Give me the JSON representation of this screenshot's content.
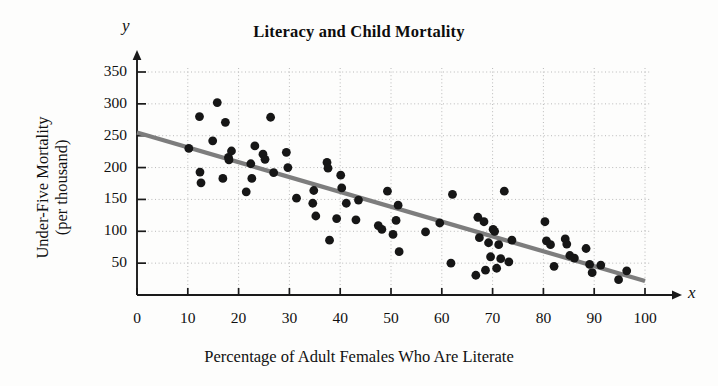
{
  "chart_data": {
    "type": "scatter",
    "title": "Literacy and Child Mortality",
    "xlabel": "Percentage of Adult Females Who Are Literate",
    "ylabel": "Under-Five Mortality\n(per thousand)",
    "ylabel_line1": "Under-Five Mortality",
    "ylabel_line2": "(per thousand)",
    "x_axis_letter": "y",
    "y_axis_letter": "x",
    "axis_letter_x": "x",
    "axis_letter_y": "y",
    "xlim": [
      0,
      100
    ],
    "ylim": [
      0,
      350
    ],
    "xticks": [
      0,
      10,
      20,
      30,
      40,
      50,
      60,
      70,
      80,
      90,
      100
    ],
    "yticks": [
      50,
      100,
      150,
      200,
      250,
      300,
      350
    ],
    "xtick_labels": [
      "0",
      "10",
      "20",
      "30",
      "40",
      "50",
      "60",
      "70",
      "80",
      "90",
      "100"
    ],
    "ytick_labels": [
      "50",
      "100",
      "150",
      "200",
      "250",
      "300",
      "350"
    ],
    "grid": true,
    "grid_style": "dotted",
    "legend": "none",
    "point_color": "#161616",
    "line_color": "#7d7d7d",
    "grid_color": "#b9b9b9",
    "axis_color": "#1a1a1a",
    "point_radius": 4.4,
    "trendline": {
      "name": "least-squares regression line",
      "x_start": 0,
      "y_start": 255,
      "x_end": 100,
      "y_end": 22,
      "slope": -2.33,
      "intercept": 255
    },
    "series": [
      {
        "name": "Countries",
        "points": [
          [
            10.2,
            230
          ],
          [
            12.3,
            280
          ],
          [
            12.4,
            193
          ],
          [
            12.6,
            176
          ],
          [
            14.9,
            242
          ],
          [
            15.8,
            302
          ],
          [
            16.9,
            183
          ],
          [
            17.4,
            271
          ],
          [
            18.0,
            216
          ],
          [
            18.1,
            212
          ],
          [
            18.6,
            226
          ],
          [
            21.5,
            162
          ],
          [
            22.4,
            206
          ],
          [
            22.6,
            183
          ],
          [
            23.2,
            234
          ],
          [
            24.8,
            221
          ],
          [
            25.2,
            213
          ],
          [
            26.3,
            279
          ],
          [
            26.9,
            192
          ],
          [
            29.4,
            224
          ],
          [
            29.7,
            200
          ],
          [
            31.4,
            152
          ],
          [
            34.6,
            144
          ],
          [
            34.8,
            164
          ],
          [
            35.2,
            124
          ],
          [
            37.4,
            208
          ],
          [
            37.6,
            199
          ],
          [
            37.9,
            86
          ],
          [
            39.3,
            120
          ],
          [
            40.1,
            188
          ],
          [
            40.3,
            168
          ],
          [
            41.2,
            144
          ],
          [
            43.1,
            118
          ],
          [
            43.6,
            149
          ],
          [
            47.5,
            109
          ],
          [
            48.2,
            103
          ],
          [
            49.3,
            163
          ],
          [
            50.4,
            95
          ],
          [
            51.0,
            117
          ],
          [
            51.4,
            141
          ],
          [
            51.6,
            68
          ],
          [
            56.8,
            99
          ],
          [
            59.6,
            113
          ],
          [
            61.8,
            50
          ],
          [
            62.1,
            158
          ],
          [
            66.7,
            31
          ],
          [
            67.1,
            122
          ],
          [
            67.4,
            90
          ],
          [
            68.3,
            115
          ],
          [
            68.6,
            39
          ],
          [
            69.2,
            82
          ],
          [
            69.6,
            60
          ],
          [
            70.1,
            103
          ],
          [
            70.4,
            100
          ],
          [
            70.8,
            42
          ],
          [
            71.2,
            79
          ],
          [
            71.6,
            57
          ],
          [
            72.3,
            163
          ],
          [
            73.2,
            52
          ],
          [
            73.8,
            86
          ],
          [
            80.3,
            115
          ],
          [
            80.6,
            85
          ],
          [
            81.4,
            79
          ],
          [
            82.1,
            45
          ],
          [
            84.3,
            88
          ],
          [
            84.6,
            80
          ],
          [
            85.2,
            62
          ],
          [
            86.1,
            58
          ],
          [
            88.4,
            73
          ],
          [
            89.1,
            48
          ],
          [
            89.6,
            35
          ],
          [
            91.3,
            47
          ],
          [
            94.8,
            24
          ],
          [
            96.4,
            38
          ]
        ]
      }
    ]
  }
}
